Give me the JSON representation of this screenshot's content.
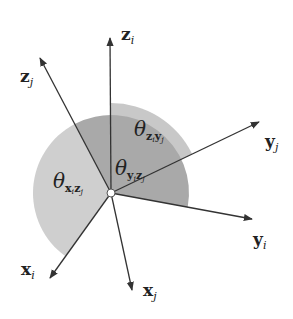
{
  "colors": {
    "axis": "#333333",
    "sector_light": "#cfcfcf",
    "sector_dark": "#a9a9a9",
    "sector_zy": "#c8c8c8",
    "origin_fill": "#ffffff"
  },
  "axes": [
    {
      "id": "zi",
      "base": "z",
      "sub": "i"
    },
    {
      "id": "zj",
      "base": "z",
      "sub": "j"
    },
    {
      "id": "yj",
      "base": "y",
      "sub": "j"
    },
    {
      "id": "yi",
      "base": "y",
      "sub": "i"
    },
    {
      "id": "xi",
      "base": "x",
      "sub": "i"
    },
    {
      "id": "xj",
      "base": "x",
      "sub": "j"
    }
  ],
  "angles": [
    {
      "id": "xizj",
      "symbol": "θ",
      "a": "x",
      "ai": "i",
      "b": "z",
      "bi": "j",
      "between": [
        "x_i",
        "z_j"
      ]
    },
    {
      "id": "yizj",
      "symbol": "θ",
      "a": "y",
      "ai": "i",
      "b": "z",
      "bi": "j",
      "between": [
        "y_i",
        "z_j"
      ]
    },
    {
      "id": "ziyj",
      "symbol": "θ",
      "a": "z",
      "ai": "i",
      "b": "y",
      "bi": "j",
      "between": [
        "z_i",
        "y_j"
      ]
    }
  ]
}
